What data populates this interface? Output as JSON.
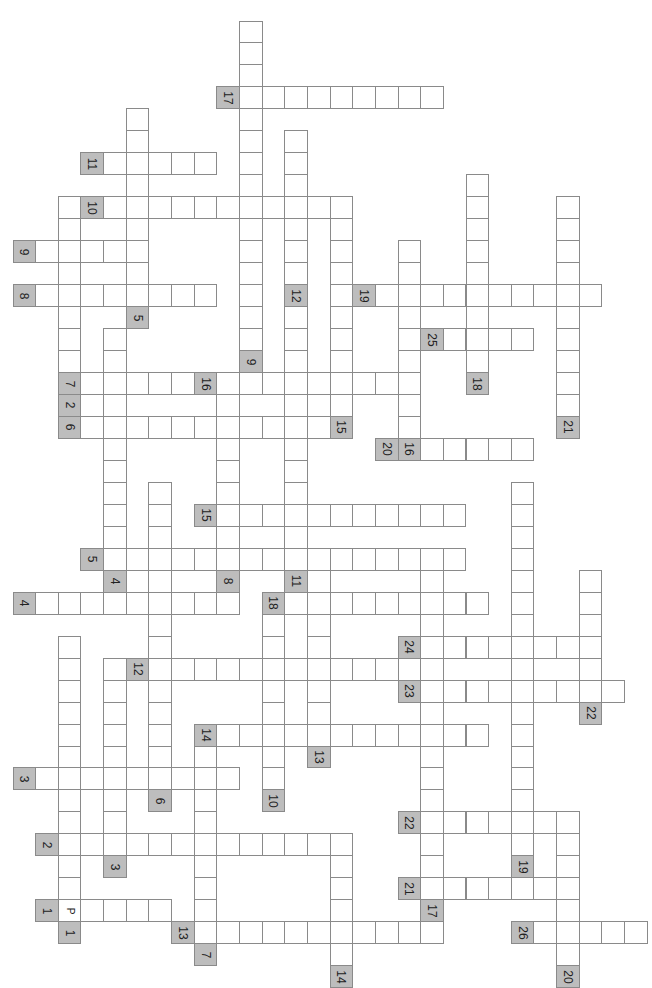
{
  "puzzle": {
    "title": "Crossword Puzzle",
    "orientation": "rotated-90",
    "grid": {
      "origin_x": 12.5,
      "origin_y": 20.5,
      "cell_w": 22.65,
      "cell_h": 21.97
    },
    "colors": {
      "label_bg": "#bdbdbd",
      "cell_bg": "#ffffff",
      "border": "#8a8a8a"
    },
    "horizontal_words": [
      {
        "label": "17",
        "row": 3,
        "col": 9,
        "len": 9
      },
      {
        "label": "11",
        "row": 6,
        "col": 3,
        "len": 5
      },
      {
        "label": "10",
        "row": 8,
        "col": 3,
        "len": 11,
        "pre": 1
      },
      {
        "label": "9",
        "row": 10,
        "col": 0,
        "len": 5
      },
      {
        "label": "8",
        "row": 12,
        "col": 0,
        "len": 8
      },
      {
        "label": "19",
        "row": 12,
        "col": 15,
        "len": 10
      },
      {
        "label": "25",
        "row": 14,
        "col": 18,
        "len": 4,
        "pre": 1
      },
      {
        "label": "7",
        "row": 16,
        "col": 2,
        "len": 5
      },
      {
        "label": "16",
        "row": 16,
        "col": 8,
        "len": 9
      },
      {
        "label": "6",
        "row": 18,
        "col": 2,
        "len": 11
      },
      {
        "label": "20",
        "row": 19,
        "col": 16,
        "len": 6
      },
      {
        "label": "15",
        "row": 22,
        "col": 8,
        "len": 11
      },
      {
        "label": "5",
        "row": 24,
        "col": 3,
        "len": 16
      },
      {
        "label": "4",
        "row": 26,
        "col": 0,
        "len": 9
      },
      {
        "label": "18",
        "row": 26,
        "col": 11,
        "len": 9
      },
      {
        "label": "24",
        "row": 28,
        "col": 17,
        "len": 8
      },
      {
        "label": "12",
        "row": 29,
        "col": 5,
        "len": 12,
        "pre": 1
      },
      {
        "label": "23",
        "row": 30,
        "col": 17,
        "len": 9
      },
      {
        "label": "14",
        "row": 32,
        "col": 8,
        "len": 12
      },
      {
        "label": "3",
        "row": 34,
        "col": 0,
        "len": 9
      },
      {
        "label": "22",
        "row": 36,
        "col": 17,
        "len": 7
      },
      {
        "label": "2",
        "row": 37,
        "col": 1,
        "len": 13
      },
      {
        "label": "21",
        "row": 39,
        "col": 17,
        "len": 7
      },
      {
        "label": "1",
        "row": 40,
        "col": 1,
        "len": 5,
        "letters": {
          "0": "P"
        }
      },
      {
        "label": "13",
        "row": 41,
        "col": 7,
        "len": 11
      },
      {
        "label": "26",
        "row": 41,
        "col": 22,
        "len": 5
      }
    ],
    "vertical_words": [
      {
        "label": "9",
        "row": 15,
        "col": 10,
        "start": 0,
        "end": 14
      },
      {
        "label": "5",
        "row": 13,
        "col": 5,
        "start": 4,
        "end": 12
      },
      {
        "label": "12",
        "row": 12,
        "col": 12,
        "start": 5,
        "end": 11
      },
      {
        "label": "2",
        "row": 17,
        "col": 2,
        "start": 8,
        "end": 16
      },
      {
        "label": "15",
        "row": 18,
        "col": 14,
        "start": 8,
        "end": 17
      },
      {
        "label": "16",
        "row": 19,
        "col": 17,
        "start": 10,
        "end": 18
      },
      {
        "label": "18",
        "row": 16,
        "col": 20,
        "start": 7,
        "end": 15
      },
      {
        "label": "21",
        "row": 18,
        "col": 24,
        "start": 8,
        "end": 17
      },
      {
        "label": "4",
        "row": 25,
        "col": 4,
        "start": 14,
        "end": 24
      },
      {
        "label": "8",
        "row": 25,
        "col": 9,
        "start": 17,
        "end": 24
      },
      {
        "label": "11",
        "row": 25,
        "col": 12,
        "start": 5,
        "end": 24
      },
      {
        "label": "13",
        "row": 33,
        "col": 13,
        "start": 25,
        "end": 32
      },
      {
        "label": "6",
        "row": 35,
        "col": 6,
        "start": 21,
        "end": 34
      },
      {
        "label": "10",
        "row": 35,
        "col": 11,
        "start": 27,
        "end": 34
      },
      {
        "label": "3",
        "row": 38,
        "col": 4,
        "start": 29,
        "end": 37
      },
      {
        "label": "7",
        "row": 42,
        "col": 8,
        "start": 33,
        "end": 41
      },
      {
        "label": "1",
        "row": 41,
        "col": 2,
        "start": 28,
        "end": 40
      },
      {
        "label": "14",
        "row": 43,
        "col": 14,
        "start": 38,
        "end": 42
      },
      {
        "label": "17",
        "row": 40,
        "col": 18,
        "start": 24,
        "end": 39
      },
      {
        "label": "19",
        "row": 38,
        "col": 22,
        "start": 21,
        "end": 37
      },
      {
        "label": "20",
        "row": 43,
        "col": 24,
        "start": 36,
        "end": 42
      },
      {
        "label": "22",
        "row": 31,
        "col": 25,
        "start": 25,
        "end": 30
      }
    ]
  }
}
